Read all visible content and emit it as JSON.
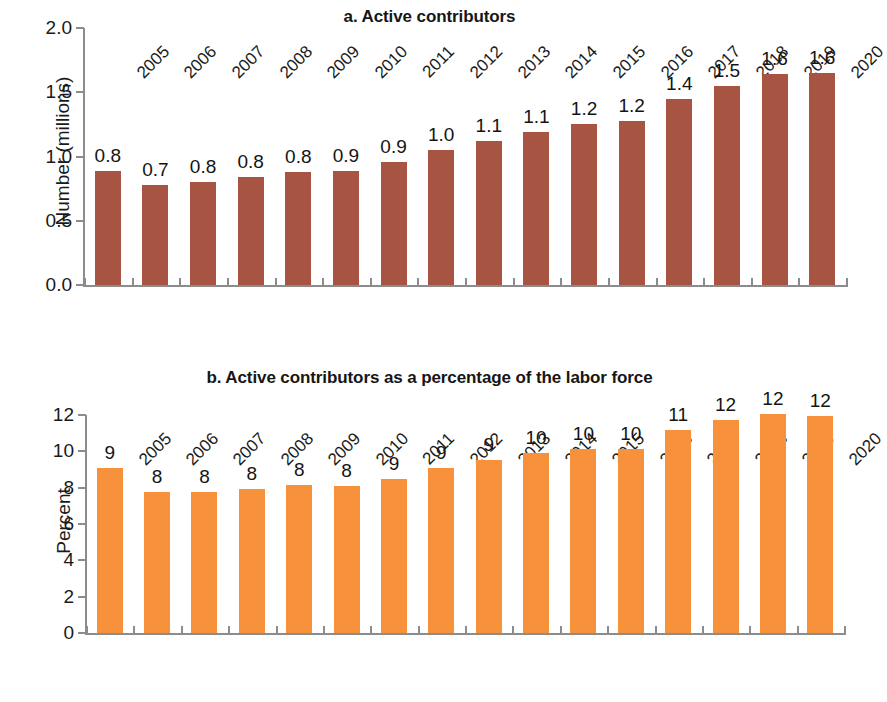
{
  "figure": {
    "panels": [
      {
        "id": "panel-a",
        "title": "a. Active contributors",
        "ylabel": "Number (millions)"
      },
      {
        "id": "panel-b",
        "title": "b. Active contributors as a percentage of the labor force",
        "ylabel": "Percent"
      }
    ],
    "colors": {
      "bar_a": "#a75443",
      "bar_b": "#f7913b",
      "axis": "#8c8c8c",
      "text": "#1a1a1a",
      "background": "#ffffff"
    }
  },
  "chart_data": [
    {
      "type": "bar",
      "title": "a. Active contributors",
      "xlabel": "",
      "ylabel": "Number (millions)",
      "ylim": [
        0.0,
        2.0
      ],
      "yticks": [
        "0.0",
        "0.5",
        "1.0",
        "1.5",
        "2.0"
      ],
      "ytick_values": [
        0.0,
        0.5,
        1.0,
        1.5,
        2.0
      ],
      "grid": false,
      "legend": "none",
      "categories": [
        "2005",
        "2006",
        "2007",
        "2008",
        "2009",
        "2010",
        "2011",
        "2012",
        "2013",
        "2014",
        "2015",
        "2016",
        "2017",
        "2018",
        "2019",
        "2020"
      ],
      "values": [
        0.89,
        0.78,
        0.8,
        0.84,
        0.88,
        0.89,
        0.96,
        1.05,
        1.12,
        1.19,
        1.25,
        1.28,
        1.45,
        1.55,
        1.64,
        1.65
      ],
      "data_labels": [
        "0.8",
        "0.7",
        "0.8",
        "0.8",
        "0.8",
        "0.9",
        "0.9",
        "1.0",
        "1.1",
        "1.1",
        "1.2",
        "1.2",
        "1.4",
        "1.5",
        "1.6",
        "1.6"
      ],
      "color": "#a75443"
    },
    {
      "type": "bar",
      "title": "b. Active contributors as a percentage of the labor force",
      "xlabel": "",
      "ylabel": "Percent",
      "ylim": [
        0,
        12
      ],
      "yticks": [
        "0",
        "2",
        "4",
        "6",
        "8",
        "10",
        "12"
      ],
      "ytick_values": [
        0,
        2,
        4,
        6,
        8,
        10,
        12
      ],
      "grid": false,
      "legend": "none",
      "categories": [
        "2005",
        "2006",
        "2007",
        "2008",
        "2009",
        "2010",
        "2011",
        "2012",
        "2013",
        "2014",
        "2015",
        "2016",
        "2017",
        "2018",
        "2019",
        "2020"
      ],
      "values": [
        9.1,
        7.75,
        7.75,
        7.95,
        8.15,
        8.1,
        8.5,
        9.1,
        9.55,
        9.9,
        10.15,
        10.15,
        11.15,
        11.7,
        12.05,
        11.95
      ],
      "data_labels": [
        "9",
        "8",
        "8",
        "8",
        "8",
        "8",
        "9",
        "9",
        "10",
        "10",
        "10",
        "11",
        "12",
        "12",
        "12",
        "12"
      ],
      "displayed_labels": [
        "9",
        "8",
        "8",
        "8",
        "8",
        "8",
        "9",
        "9",
        "9",
        "10",
        "10",
        "10",
        "11",
        "12",
        "12",
        "12"
      ],
      "color": "#f7913b"
    }
  ]
}
